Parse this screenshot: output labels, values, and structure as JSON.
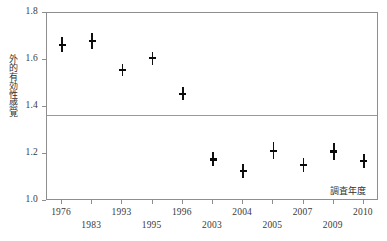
{
  "chart_data": {
    "type": "scatter",
    "title": "",
    "subtitle": "",
    "xlabel": "調査年度",
    "ylabel": "外的有効性感覚",
    "ylim": [
      1.0,
      1.8
    ],
    "yticks": [
      "1.0",
      "1.2",
      "1.4",
      "1.6",
      "1.8"
    ],
    "ytick_values": [
      1.0,
      1.2,
      1.4,
      1.6,
      1.8
    ],
    "grid": false,
    "legend": null,
    "legend_position": "none",
    "categories": [
      "1976",
      "1983",
      "1993",
      "1995",
      "1996",
      "2003",
      "2004",
      "2005",
      "2007",
      "2009",
      "2010"
    ],
    "values": [
      1.665,
      1.68,
      1.557,
      1.608,
      1.456,
      1.177,
      1.127,
      1.214,
      1.153,
      1.21,
      1.17
    ],
    "ci_low": [
      1.632,
      1.646,
      1.53,
      1.58,
      1.428,
      1.148,
      1.098,
      1.18,
      1.123,
      1.176,
      1.139
    ],
    "ci_high": [
      1.7,
      1.714,
      1.585,
      1.636,
      1.484,
      1.207,
      1.156,
      1.25,
      1.184,
      1.245,
      1.201
    ],
    "reference_line": 1.365,
    "marker": "point-with-error-bar",
    "series": [
      {
        "name": "外的有効性感覚",
        "values": [
          1.665,
          1.68,
          1.557,
          1.608,
          1.456,
          1.177,
          1.127,
          1.214,
          1.153,
          1.21,
          1.17
        ]
      }
    ],
    "xtick_rows": [
      0,
      1,
      0,
      1,
      0,
      1,
      0,
      1,
      0,
      1,
      0
    ],
    "colors": {
      "marker": "#0a0a0a",
      "error_bar": "#101010",
      "frame": "#8e8e8e",
      "reference_line": "#9a9a9a",
      "background": "#ffffff",
      "text": "#3a3a3a"
    }
  }
}
